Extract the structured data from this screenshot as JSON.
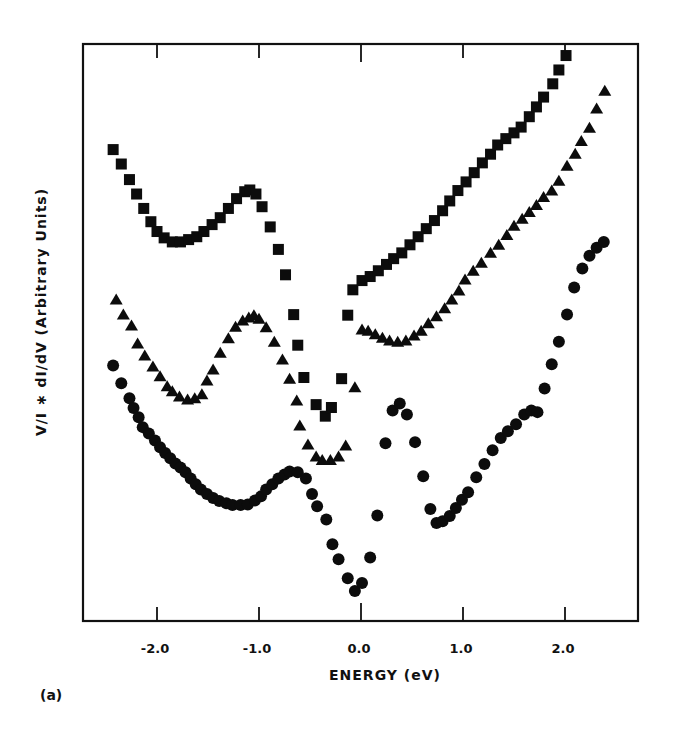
{
  "figure": {
    "panel_label": "(a)",
    "xlabel": "ENERGY (eV)",
    "ylabel": "V/I ∗ dI/dV (Arbitrary Units)",
    "xticks": [
      "-2.0",
      "-1.0",
      "0.0",
      "1.0",
      "2.0"
    ]
  },
  "chart_data": {
    "type": "scatter",
    "title": "",
    "xlabel": "ENERGY (eV)",
    "ylabel": "V/I * dI/dV (Arbitrary Units)",
    "xlim": [
      -2.75,
      2.72
    ],
    "ylim": [
      0,
      100
    ],
    "x_ticks": [
      -2.0,
      -1.0,
      0.0,
      1.0,
      2.0
    ],
    "y_ticks": [],
    "grid": false,
    "legend": null,
    "panel_label": "(a)",
    "series": [
      {
        "name": "squares",
        "marker": "square",
        "points": [
          [
            -2.43,
            81.7
          ],
          [
            -2.35,
            79.2
          ],
          [
            -2.27,
            76.5
          ],
          [
            -2.2,
            74.0
          ],
          [
            -2.13,
            71.5
          ],
          [
            -2.06,
            69.2
          ],
          [
            -2.0,
            67.5
          ],
          [
            -1.93,
            66.4
          ],
          [
            -1.85,
            65.7
          ],
          [
            -1.77,
            65.7
          ],
          [
            -1.69,
            66.1
          ],
          [
            -1.61,
            66.6
          ],
          [
            -1.54,
            67.5
          ],
          [
            -1.46,
            68.7
          ],
          [
            -1.38,
            69.9
          ],
          [
            -1.3,
            71.5
          ],
          [
            -1.22,
            73.2
          ],
          [
            -1.14,
            74.4
          ],
          [
            -1.09,
            74.7
          ],
          [
            -1.03,
            74.0
          ],
          [
            -0.97,
            71.8
          ],
          [
            -0.89,
            68.3
          ],
          [
            -0.81,
            64.4
          ],
          [
            -0.74,
            60.0
          ],
          [
            -0.66,
            53.1
          ],
          [
            -0.62,
            47.8
          ],
          [
            -0.56,
            42.2
          ],
          [
            -0.44,
            37.5
          ],
          [
            -0.35,
            35.5
          ],
          [
            -0.29,
            37.0
          ],
          [
            -0.19,
            42.0
          ],
          [
            -0.13,
            53.0
          ],
          [
            -0.08,
            57.4
          ],
          [
            0.01,
            59.0
          ],
          [
            0.09,
            59.7
          ],
          [
            0.17,
            60.7
          ],
          [
            0.25,
            61.8
          ],
          [
            0.32,
            62.8
          ],
          [
            0.4,
            63.8
          ],
          [
            0.48,
            65.2
          ],
          [
            0.56,
            66.6
          ],
          [
            0.64,
            68.0
          ],
          [
            0.72,
            69.4
          ],
          [
            0.8,
            71.1
          ],
          [
            0.87,
            72.8
          ],
          [
            0.95,
            74.6
          ],
          [
            1.03,
            76.1
          ],
          [
            1.11,
            77.7
          ],
          [
            1.19,
            79.4
          ],
          [
            1.27,
            80.9
          ],
          [
            1.34,
            82.5
          ],
          [
            1.42,
            83.6
          ],
          [
            1.5,
            84.6
          ],
          [
            1.57,
            85.6
          ],
          [
            1.65,
            87.4
          ],
          [
            1.72,
            89.1
          ],
          [
            1.79,
            90.8
          ],
          [
            1.88,
            93.1
          ],
          [
            1.94,
            95.5
          ],
          [
            2.01,
            98.0
          ]
        ]
      },
      {
        "name": "triangles",
        "marker": "triangle",
        "points": [
          [
            -2.4,
            55.7
          ],
          [
            -2.33,
            53.1
          ],
          [
            -2.25,
            51.2
          ],
          [
            -2.19,
            48.1
          ],
          [
            -2.12,
            46.0
          ],
          [
            -2.04,
            44.1
          ],
          [
            -1.97,
            42.4
          ],
          [
            -1.9,
            40.7
          ],
          [
            -1.85,
            39.8
          ],
          [
            -1.78,
            38.9
          ],
          [
            -1.7,
            38.4
          ],
          [
            -1.63,
            38.6
          ],
          [
            -1.56,
            39.3
          ],
          [
            -1.51,
            41.7
          ],
          [
            -1.45,
            43.6
          ],
          [
            -1.38,
            46.5
          ],
          [
            -1.3,
            49.0
          ],
          [
            -1.23,
            51.0
          ],
          [
            -1.16,
            52.1
          ],
          [
            -1.1,
            52.6
          ],
          [
            -1.05,
            53.0
          ],
          [
            -1.0,
            52.4
          ],
          [
            -0.93,
            50.9
          ],
          [
            -0.85,
            48.4
          ],
          [
            -0.77,
            45.3
          ],
          [
            -0.7,
            42.0
          ],
          [
            -0.63,
            38.2
          ],
          [
            -0.6,
            33.9
          ],
          [
            -0.52,
            30.6
          ],
          [
            -0.44,
            28.5
          ],
          [
            -0.38,
            27.9
          ],
          [
            -0.3,
            27.9
          ],
          [
            -0.22,
            28.5
          ],
          [
            -0.15,
            30.4
          ],
          [
            -0.06,
            40.5
          ],
          [
            0.01,
            50.5
          ],
          [
            0.07,
            50.3
          ],
          [
            0.14,
            49.7
          ],
          [
            0.21,
            49.1
          ],
          [
            0.28,
            48.6
          ],
          [
            0.36,
            48.4
          ],
          [
            0.44,
            48.6
          ],
          [
            0.52,
            49.5
          ],
          [
            0.59,
            50.3
          ],
          [
            0.66,
            51.6
          ],
          [
            0.74,
            52.8
          ],
          [
            0.82,
            54.2
          ],
          [
            0.89,
            55.7
          ],
          [
            0.96,
            57.3
          ],
          [
            1.02,
            59.2
          ],
          [
            1.1,
            60.7
          ],
          [
            1.18,
            62.1
          ],
          [
            1.27,
            63.8
          ],
          [
            1.35,
            65.2
          ],
          [
            1.43,
            66.9
          ],
          [
            1.5,
            68.5
          ],
          [
            1.58,
            69.7
          ],
          [
            1.65,
            70.9
          ],
          [
            1.72,
            72.1
          ],
          [
            1.79,
            73.5
          ],
          [
            1.87,
            74.6
          ],
          [
            1.94,
            76.3
          ],
          [
            2.02,
            78.9
          ],
          [
            2.1,
            81.0
          ],
          [
            2.16,
            83.2
          ],
          [
            2.24,
            85.5
          ],
          [
            2.31,
            88.8
          ],
          [
            2.39,
            91.9
          ]
        ]
      },
      {
        "name": "circles",
        "marker": "circle",
        "points": [
          [
            -2.43,
            44.3
          ],
          [
            -2.35,
            41.2
          ],
          [
            -2.27,
            38.6
          ],
          [
            -2.23,
            36.9
          ],
          [
            -2.18,
            35.3
          ],
          [
            -2.14,
            33.6
          ],
          [
            -2.08,
            32.5
          ],
          [
            -2.02,
            31.3
          ],
          [
            -1.97,
            30.1
          ],
          [
            -1.92,
            29.1
          ],
          [
            -1.87,
            28.2
          ],
          [
            -1.82,
            27.3
          ],
          [
            -1.77,
            26.6
          ],
          [
            -1.72,
            25.8
          ],
          [
            -1.67,
            24.7
          ],
          [
            -1.62,
            23.7
          ],
          [
            -1.57,
            22.8
          ],
          [
            -1.51,
            22.0
          ],
          [
            -1.45,
            21.3
          ],
          [
            -1.39,
            20.8
          ],
          [
            -1.32,
            20.4
          ],
          [
            -1.26,
            20.1
          ],
          [
            -1.18,
            20.1
          ],
          [
            -1.11,
            20.2
          ],
          [
            -1.04,
            20.9
          ],
          [
            -0.98,
            21.6
          ],
          [
            -0.93,
            22.8
          ],
          [
            -0.87,
            23.7
          ],
          [
            -0.81,
            24.7
          ],
          [
            -0.75,
            25.4
          ],
          [
            -0.7,
            25.9
          ],
          [
            -0.62,
            25.8
          ],
          [
            -0.54,
            24.7
          ],
          [
            -0.48,
            22.0
          ],
          [
            -0.43,
            19.9
          ],
          [
            -0.34,
            17.6
          ],
          [
            -0.28,
            13.3
          ],
          [
            -0.22,
            10.7
          ],
          [
            -0.13,
            7.4
          ],
          [
            -0.06,
            5.2
          ],
          [
            0.01,
            6.6
          ],
          [
            0.09,
            11.0
          ],
          [
            0.16,
            18.3
          ],
          [
            0.24,
            30.8
          ],
          [
            0.31,
            36.5
          ],
          [
            0.38,
            37.7
          ],
          [
            0.45,
            35.8
          ],
          [
            0.53,
            31.0
          ],
          [
            0.61,
            25.1
          ],
          [
            0.68,
            19.4
          ],
          [
            0.74,
            17.0
          ],
          [
            0.8,
            17.3
          ],
          [
            0.87,
            18.2
          ],
          [
            0.93,
            19.6
          ],
          [
            0.99,
            21.0
          ],
          [
            1.05,
            22.3
          ],
          [
            1.13,
            24.9
          ],
          [
            1.21,
            27.2
          ],
          [
            1.29,
            29.6
          ],
          [
            1.37,
            31.7
          ],
          [
            1.44,
            32.9
          ],
          [
            1.52,
            34.1
          ],
          [
            1.6,
            35.8
          ],
          [
            1.67,
            36.5
          ],
          [
            1.73,
            36.2
          ],
          [
            1.8,
            40.3
          ],
          [
            1.87,
            44.5
          ],
          [
            1.94,
            48.4
          ],
          [
            2.02,
            53.1
          ],
          [
            2.09,
            57.8
          ],
          [
            2.17,
            61.1
          ],
          [
            2.24,
            63.3
          ],
          [
            2.31,
            64.7
          ],
          [
            2.38,
            65.7
          ]
        ]
      }
    ]
  }
}
